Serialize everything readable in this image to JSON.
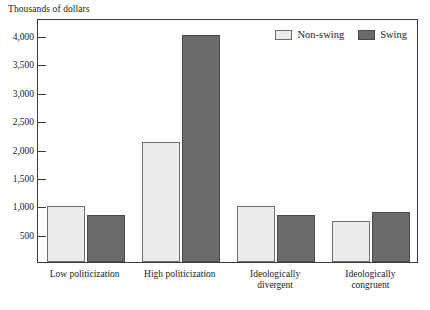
{
  "chart_data": {
    "type": "bar",
    "title": "",
    "ylabel": "Thousands of dollars",
    "xlabel": "",
    "ylim": [
      0,
      4300
    ],
    "yticks": [
      500,
      1000,
      1500,
      2000,
      2500,
      3000,
      3500,
      4000
    ],
    "ytick_labels": [
      "500",
      "1,000",
      "1,500",
      "2,000",
      "2,500",
      "3,000",
      "3,500",
      "4,000"
    ],
    "grid": false,
    "legend_position": "top-right",
    "categories": [
      "Low politicization",
      "High politicization",
      "Ideologically divergent",
      "Ideologically congruent"
    ],
    "category_lines": [
      [
        "Low politicization"
      ],
      [
        "High politicization"
      ],
      [
        "Ideologically",
        "divergent"
      ],
      [
        "Ideologically",
        "congruent"
      ]
    ],
    "series": [
      {
        "name": "Non-swing",
        "color": "#ececec",
        "values": [
          990,
          2120,
          990,
          730
        ]
      },
      {
        "name": "Swing",
        "color": "#6b6b6b",
        "values": [
          820,
          4000,
          820,
          890
        ]
      }
    ]
  }
}
